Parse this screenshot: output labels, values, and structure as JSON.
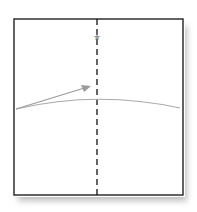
{
  "diagram": {
    "type": "origami-step",
    "paper": {
      "x": 13,
      "y": 19,
      "width": 170,
      "height": 176,
      "fill": "#ffffff",
      "stroke": "#222222"
    },
    "fold_line": {
      "style": "valley-dashed",
      "x": 97,
      "color": "#111111"
    },
    "marker": {
      "symbol": "★",
      "label": "reference point",
      "x": 97,
      "y": 36,
      "color": "#9a9a9a"
    },
    "crease_curve": {
      "color": "#aaaaaa"
    },
    "arrow": {
      "color": "#9a9a9a",
      "direction": "fold toward center"
    }
  }
}
